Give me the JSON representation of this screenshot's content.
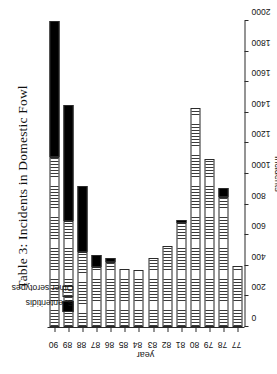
{
  "caption": "Table 3: Incidents in Domestic Fowl",
  "axes": {
    "value_axis_title": "incidents",
    "category_axis_title": "year",
    "value_ticks": [
      "0",
      "200",
      "400",
      "600",
      "800",
      "1000",
      "1200",
      "1400",
      "1600",
      "1800",
      "2000"
    ]
  },
  "legend": {
    "entries": [
      {
        "label": "S. enteritidis",
        "swatch": "black-fill"
      },
      {
        "label": "Other serotypes",
        "swatch": "vertical-hatch-fill"
      }
    ]
  },
  "chart_data": {
    "type": "bar",
    "orientation": "horizontal-stacked",
    "title": "Table 3: Incidents in Domestic Fowl",
    "xlabel": "incidents",
    "ylabel": "year",
    "xlim": [
      0,
      2000
    ],
    "grid": false,
    "legend_position": "upper-left",
    "categories": [
      "77",
      "78",
      "79",
      "80",
      "81",
      "82",
      "83",
      "84",
      "85",
      "86",
      "87",
      "88",
      "89",
      "90"
    ],
    "series": [
      {
        "name": "S. enteritidis",
        "color": "#000000",
        "values": [
          0,
          60,
          0,
          0,
          20,
          0,
          0,
          0,
          0,
          25,
          75,
          430,
          760,
          890
        ]
      },
      {
        "name": "Other serotypes",
        "color": "#f2f2f2",
        "values": [
          400,
          850,
          1100,
          1430,
          680,
          530,
          450,
          370,
          380,
          425,
          395,
          490,
          690,
          1110
        ]
      }
    ],
    "totals": [
      400,
      910,
      1100,
      1430,
      700,
      530,
      450,
      370,
      380,
      450,
      470,
      920,
      1450,
      2000
    ]
  }
}
